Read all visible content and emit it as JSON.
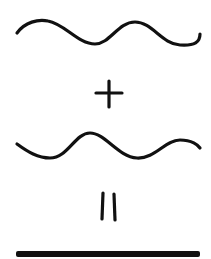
{
  "diagram": {
    "title": "Destructive wave interference",
    "operator_plus": "+",
    "operator_equals": "=",
    "stroke_color": "#111111",
    "background": "#ffffff",
    "elements": [
      {
        "id": "wave-1",
        "label": "Wave",
        "phase": "0"
      },
      {
        "id": "plus-sign",
        "label": "+"
      },
      {
        "id": "wave-2",
        "label": "Inverted wave",
        "phase": "180°"
      },
      {
        "id": "equals-sign",
        "label": "="
      },
      {
        "id": "flat-line",
        "label": "Resulting flat line (cancellation)"
      }
    ]
  }
}
